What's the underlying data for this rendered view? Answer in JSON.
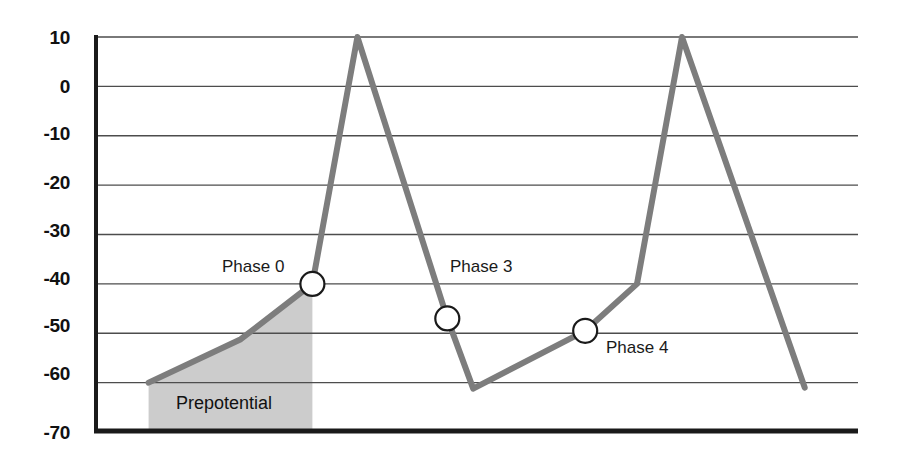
{
  "chart_data": {
    "type": "line",
    "title": "",
    "subtitle": "",
    "xlabel": "",
    "ylabel": "",
    "ylim": [
      -70,
      10
    ],
    "xlim": [
      0,
      100
    ],
    "grid": true,
    "legend_position": "none",
    "y_ticks": [
      10,
      0,
      -10,
      -20,
      -30,
      -40,
      -50,
      -60,
      -70
    ],
    "y_tick_labels": [
      "10",
      "0",
      "-10",
      "-20",
      "-30",
      "-40",
      "-50",
      "-60",
      "-70"
    ],
    "x_ticks": [],
    "x_tick_labels": [],
    "series": [
      {
        "name": "membrane-potential",
        "color": "#7d7d7d",
        "line_width": 6,
        "points": [
          {
            "x": 6.9,
            "y": -60.0
          },
          {
            "x": 19.0,
            "y": -51.2
          },
          {
            "x": 28.4,
            "y": -40.0
          },
          {
            "x": 34.3,
            "y": 10.0
          },
          {
            "x": 46.1,
            "y": -47.0
          },
          {
            "x": 49.5,
            "y": -61.2
          },
          {
            "x": 64.2,
            "y": -49.5
          },
          {
            "x": 71.0,
            "y": -40.0
          },
          {
            "x": 76.9,
            "y": 10.0
          },
          {
            "x": 93.0,
            "y": -61.0
          }
        ]
      }
    ],
    "markers": [
      {
        "label": "Phase 0",
        "x": 28.4,
        "y": -40.0,
        "radius_px": 12,
        "fill": "#ffffff",
        "stroke": "#1a1a1a"
      },
      {
        "label": "Phase 3",
        "x": 46.1,
        "y": -47.0,
        "radius_px": 12,
        "fill": "#ffffff",
        "stroke": "#1a1a1a"
      },
      {
        "label": "Phase 4",
        "x": 64.2,
        "y": -49.5,
        "radius_px": 12,
        "fill": "#ffffff",
        "stroke": "#1a1a1a"
      }
    ],
    "shaded_regions": [
      {
        "label": "Prepotential",
        "x_start": 6.9,
        "x_end": 28.4,
        "y_base": -70,
        "fill": "#cccccc"
      }
    ],
    "annotations": [
      {
        "text": "Phase 0",
        "x_px": 222,
        "y_px": 258
      },
      {
        "text": "Phase 3",
        "x_px": 450,
        "y_px": 258
      },
      {
        "text": "Phase 4",
        "x_px": 606,
        "y_px": 339
      },
      {
        "text": "Prepotential",
        "x_px": 176,
        "y_px": 394
      }
    ]
  },
  "axes": {
    "y_axis_color": "#1a1a1a",
    "x_axis_color": "#1a1a1a",
    "grid_color": "#4d4d4d",
    "background": "#ffffff"
  },
  "labels": {
    "y_ticks": [
      "10",
      "0",
      "-10",
      "-20",
      "-30",
      "-40",
      "-50",
      "-60",
      "-70"
    ],
    "phase0": "Phase 0",
    "phase3": "Phase 3",
    "phase4": "Phase 4",
    "prepotential": "Prepotential"
  },
  "colors": {
    "trace": "#7d7d7d",
    "shading": "#cccccc",
    "marker_fill": "#ffffff",
    "marker_stroke": "#1a1a1a",
    "grid": "#4d4d4d",
    "axis": "#1a1a1a",
    "text": "#111111"
  }
}
